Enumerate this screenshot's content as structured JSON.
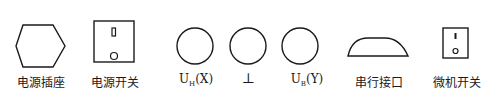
{
  "symbols": [
    {
      "id": "power-socket",
      "label": "电源插座",
      "shape": "hexagon"
    },
    {
      "id": "power-switch",
      "label": "电源开关",
      "shape": "rocker-switch"
    },
    {
      "id": "uh-x",
      "label_main": "U",
      "label_sub": "H",
      "label_suffix": "(X)",
      "shape": "circle"
    },
    {
      "id": "ground",
      "label": "⊥",
      "shape": "circle"
    },
    {
      "id": "ub-y",
      "label_main": "U",
      "label_sub": "B",
      "label_suffix": "(Y)",
      "shape": "circle"
    },
    {
      "id": "serial-port",
      "label": "串行接口",
      "shape": "d-connector"
    },
    {
      "id": "mcu-switch",
      "label": "微机开关",
      "shape": "rocker-switch-small"
    }
  ]
}
